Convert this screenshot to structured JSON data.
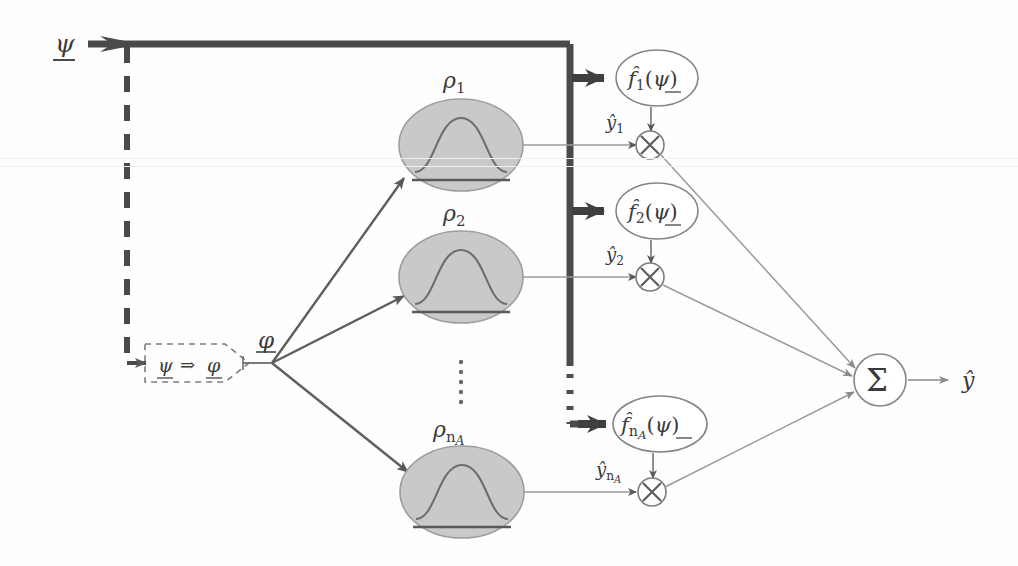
{
  "figure": {
    "background_color": "#fefefe",
    "stroke_dark": "#4a4a4a",
    "stroke_thin": "#8a8a8a",
    "ellipse_fill": "#c9c9c9",
    "ellipse_stroke": "#9a9a9a"
  },
  "input": {
    "label": "ψ",
    "underlined": true
  },
  "transform_block": {
    "from_symbol": "ψ",
    "arrow_symbol": "⇒",
    "to_symbol": "φ",
    "full_label": "ψ ⇒ φ",
    "border_style": "dashed"
  },
  "fanout": {
    "label": "φ",
    "underlined": true
  },
  "basis_nodes": [
    {
      "label": "ρ",
      "subscript": "1",
      "full_label": "ρ1",
      "kind": "gaussian-basis"
    },
    {
      "label": "ρ",
      "subscript": "2",
      "full_label": "ρ2",
      "kind": "gaussian-basis"
    },
    {
      "label": "ρ",
      "subscript": "nA",
      "full_label": "ρn_A",
      "kind": "gaussian-basis"
    }
  ],
  "function_nodes": [
    {
      "label": "f̂",
      "subscript": "1",
      "argument": "ψ",
      "full_label": "f̂1(ψ)"
    },
    {
      "label": "f̂",
      "subscript": "2",
      "argument": "ψ",
      "full_label": "f̂2(ψ)"
    },
    {
      "label": "f̂",
      "subscript": "nA",
      "argument": "ψ",
      "full_label": "f̂n_A(ψ)"
    }
  ],
  "intermediate_outputs": [
    {
      "label": "ŷ",
      "subscript": "1",
      "full_label": "ŷ1"
    },
    {
      "label": "ŷ",
      "subscript": "2",
      "full_label": "ŷ2"
    },
    {
      "label": "ŷ",
      "subscript": "nA",
      "full_label": "ŷn_A"
    }
  ],
  "product_nodes": [
    {
      "symbol": "×",
      "name": "multiply"
    },
    {
      "symbol": "×",
      "name": "multiply"
    },
    {
      "symbol": "×",
      "name": "multiply"
    }
  ],
  "sum_node": {
    "symbol": "Σ",
    "name": "summation"
  },
  "output": {
    "label": "ŷ"
  },
  "ellipsis": {
    "symbol": "⋮",
    "count": 5
  }
}
